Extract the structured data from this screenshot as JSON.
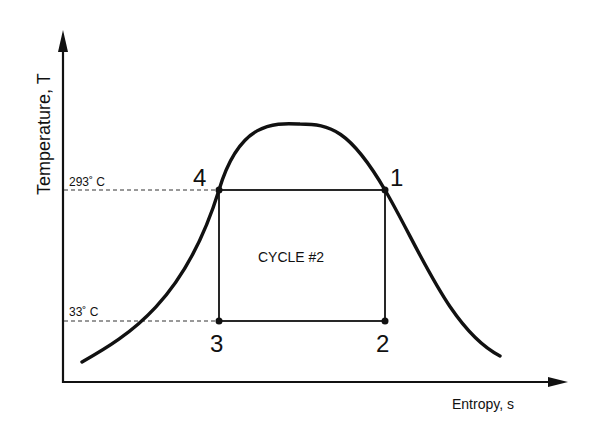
{
  "diagram": {
    "y_axis_label": "Temperature, T",
    "x_axis_label": "Entropy, s",
    "high_temp_label": "293˚ C",
    "low_temp_label": "33˚ C",
    "cycle_label": "CYCLE #2",
    "points": [
      {
        "id": "1",
        "label": "1"
      },
      {
        "id": "2",
        "label": "2"
      },
      {
        "id": "3",
        "label": "3"
      },
      {
        "id": "4",
        "label": "4"
      }
    ],
    "colors": {
      "line": "#111111",
      "dashed": "#333333",
      "background": "#ffffff"
    }
  }
}
